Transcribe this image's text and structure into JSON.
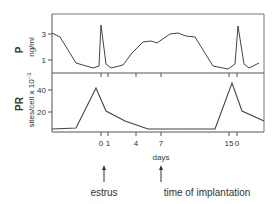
{
  "chart_data": [
    {
      "type": "line",
      "panel": "top",
      "ylabel": "P",
      "ylabel_units": "ng/ml",
      "yticks": [
        "3",
        "1"
      ],
      "ylim": [
        0,
        4.2
      ],
      "grid": false,
      "points_px": [
        [
          52,
          33
        ],
        [
          60,
          37
        ],
        [
          76,
          63
        ],
        [
          93,
          68
        ],
        [
          99,
          66
        ],
        [
          101,
          25
        ],
        [
          106,
          64
        ],
        [
          111,
          68
        ],
        [
          123,
          65
        ],
        [
          132,
          53
        ],
        [
          143,
          42
        ],
        [
          151,
          41
        ],
        [
          157,
          43
        ],
        [
          170,
          34
        ],
        [
          178,
          33
        ],
        [
          186,
          36
        ],
        [
          195,
          37
        ],
        [
          213,
          66
        ],
        [
          228,
          69
        ],
        [
          235,
          64
        ],
        [
          238,
          26
        ],
        [
          244,
          64
        ],
        [
          249,
          68
        ],
        [
          259,
          63
        ]
      ],
      "series": [
        {
          "name": "P (ng/ml)",
          "description": "Progesterone: ~3 at start, drops to ~0.6, sharp spike (~3.7) at estrus day 0, rises to ~2.5 plateau days 4-12, drops to ~0.5, second spike (~3.7) at next estrus"
        }
      ]
    },
    {
      "type": "line",
      "panel": "bottom",
      "ylabel": "PR",
      "ylabel_units": "sites/cell x 10^-3",
      "yticks": [
        "40",
        "20"
      ],
      "ylim": [
        0,
        50
      ],
      "grid": false,
      "points_px": [
        [
          52,
          129
        ],
        [
          76,
          128
        ],
        [
          96,
          88
        ],
        [
          106,
          111
        ],
        [
          125,
          121
        ],
        [
          148,
          129
        ],
        [
          215,
          129
        ],
        [
          232,
          83
        ],
        [
          242,
          111
        ],
        [
          264,
          121
        ]
      ],
      "series": [
        {
          "name": "PR (sites/cell x 10^-3)",
          "description": "Progesterone receptor: ~3 baseline, peak ~42 before day 0, falls to ~20 at day 1, ~3 by day 7, flat until ~day 14, peak ~45 near day 15/0, then ~20"
        }
      ]
    }
  ],
  "xaxis": {
    "label": "days",
    "ticks": [
      {
        "label": "0",
        "x": 101
      },
      {
        "label": "1",
        "x": 108
      },
      {
        "label": "4",
        "x": 136
      },
      {
        "label": "7",
        "x": 161
      },
      {
        "label": "15",
        "x": 229
      },
      {
        "label": "0",
        "x": 237
      }
    ]
  },
  "annotations": [
    {
      "label": "estrus",
      "x": 104
    },
    {
      "label": "time of implantation",
      "x": 161
    }
  ],
  "labels": {
    "p_title": "P",
    "p_units": "ng/ml",
    "pr_title": "PR",
    "pr_units": "sites/cell x 10",
    "pr_units_exp": "−3",
    "x_title": "days",
    "estrus": "estrus",
    "implantation": "time of implantation"
  },
  "colors": {
    "line": "#444444",
    "frame": "#666666",
    "text": "#333333"
  }
}
